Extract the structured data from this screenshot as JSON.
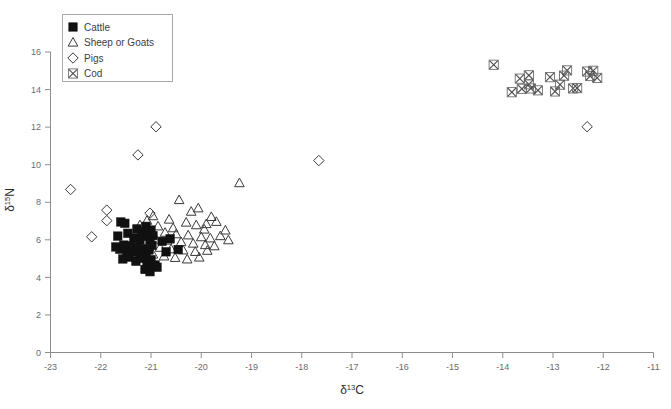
{
  "chart_data": {
    "type": "scatter",
    "title": "",
    "xlabel": "δ¹³C",
    "ylabel": "δ¹⁵N",
    "xlabel_parts": {
      "delta": "δ",
      "sup": "13",
      "elem": "C"
    },
    "ylabel_parts": {
      "delta": "δ",
      "sup": "15",
      "elem": "N"
    },
    "xlim": [
      -23,
      -11
    ],
    "ylim": [
      0,
      16
    ],
    "xticks": [
      -23,
      -22,
      -21,
      -20,
      -19,
      -18,
      -17,
      -16,
      -15,
      -14,
      -13,
      -12,
      -11
    ],
    "yticks": [
      0,
      2,
      4,
      6,
      8,
      10,
      12,
      14,
      16
    ],
    "xtick_labels": [
      "-23",
      "-22",
      "-21",
      "-20",
      "-19",
      "-18",
      "-17",
      "-16",
      "-15",
      "-14",
      "-13",
      "-12",
      "-11"
    ],
    "ytick_labels": [
      "0",
      "2",
      "4",
      "6",
      "8",
      "10",
      "12",
      "14",
      "16"
    ],
    "grid": false,
    "legend_position": "top-left",
    "legend_entries": [
      "Cattle",
      "Sheep or Goats",
      "Pigs",
      "Cod"
    ],
    "series": [
      {
        "name": "Cattle",
        "marker": "filled-square",
        "color": "#111111",
        "points": [
          [
            -21.6,
            6.95
          ],
          [
            -21.46,
            6.35
          ],
          [
            -21.34,
            6.1
          ],
          [
            -21.28,
            6.58
          ],
          [
            -21.22,
            6.0
          ],
          [
            -21.18,
            6.42
          ],
          [
            -21.14,
            6.18
          ],
          [
            -21.1,
            6.72
          ],
          [
            -21.06,
            6.3
          ],
          [
            -21.02,
            5.98
          ],
          [
            -21.0,
            6.52
          ],
          [
            -20.96,
            6.22
          ],
          [
            -21.7,
            5.62
          ],
          [
            -21.62,
            5.5
          ],
          [
            -21.54,
            5.72
          ],
          [
            -21.48,
            5.42
          ],
          [
            -21.4,
            5.68
          ],
          [
            -21.34,
            5.34
          ],
          [
            -21.28,
            5.6
          ],
          [
            -21.22,
            5.26
          ],
          [
            -21.16,
            5.54
          ],
          [
            -21.1,
            5.18
          ],
          [
            -21.04,
            5.46
          ],
          [
            -20.98,
            5.7
          ],
          [
            -21.56,
            4.98
          ],
          [
            -21.44,
            5.08
          ],
          [
            -21.3,
            4.86
          ],
          [
            -21.18,
            5.02
          ],
          [
            -21.08,
            4.74
          ],
          [
            -21.0,
            4.94
          ],
          [
            -20.92,
            4.66
          ],
          [
            -21.12,
            4.42
          ],
          [
            -21.02,
            4.3
          ],
          [
            -20.88,
            4.54
          ],
          [
            -20.78,
            5.92
          ],
          [
            -20.7,
            5.36
          ],
          [
            -20.62,
            6.05
          ],
          [
            -20.46,
            5.48
          ],
          [
            -21.66,
            6.2
          ],
          [
            -21.52,
            6.88
          ]
        ]
      },
      {
        "name": "Sheep or Goats",
        "marker": "open-triangle",
        "color": "#3a3a3a",
        "points": [
          [
            -19.24,
            9.02
          ],
          [
            -20.44,
            8.12
          ],
          [
            -20.06,
            7.68
          ],
          [
            -19.8,
            7.22
          ],
          [
            -20.64,
            7.08
          ],
          [
            -20.3,
            6.92
          ],
          [
            -20.86,
            6.72
          ],
          [
            -20.56,
            6.62
          ],
          [
            -20.1,
            6.78
          ],
          [
            -19.94,
            6.55
          ],
          [
            -19.7,
            6.96
          ],
          [
            -19.52,
            6.5
          ],
          [
            -20.72,
            6.38
          ],
          [
            -20.5,
            6.3
          ],
          [
            -20.26,
            6.24
          ],
          [
            -20.0,
            6.14
          ],
          [
            -19.82,
            6.08
          ],
          [
            -19.62,
            6.2
          ],
          [
            -20.9,
            6.02
          ],
          [
            -20.68,
            5.96
          ],
          [
            -20.4,
            5.88
          ],
          [
            -20.16,
            5.8
          ],
          [
            -19.92,
            5.72
          ],
          [
            -19.74,
            5.66
          ],
          [
            -20.82,
            5.58
          ],
          [
            -20.6,
            5.5
          ],
          [
            -20.36,
            5.44
          ],
          [
            -20.12,
            5.36
          ],
          [
            -19.88,
            5.42
          ],
          [
            -20.74,
            5.12
          ],
          [
            -20.52,
            5.04
          ],
          [
            -20.28,
            4.96
          ],
          [
            -20.04,
            5.06
          ],
          [
            -19.9,
            6.84
          ],
          [
            -19.46,
            5.98
          ],
          [
            -20.2,
            7.5
          ],
          [
            -20.96,
            5.22
          ],
          [
            -21.08,
            7.02
          ],
          [
            -21.22,
            6.78
          ],
          [
            -20.96,
            7.26
          ]
        ]
      },
      {
        "name": "Pigs",
        "marker": "open-diamond",
        "color": "#3a3a3a",
        "points": [
          [
            -22.6,
            8.68
          ],
          [
            -22.18,
            6.16
          ],
          [
            -21.88,
            7.58
          ],
          [
            -21.88,
            7.02
          ],
          [
            -21.26,
            10.52
          ],
          [
            -20.9,
            12.02
          ],
          [
            -21.02,
            7.42
          ],
          [
            -17.66,
            10.22
          ],
          [
            -12.32,
            12.02
          ]
        ]
      },
      {
        "name": "Cod",
        "marker": "x-in-box",
        "color": "#4d4d4d",
        "points": [
          [
            -14.18,
            15.32
          ],
          [
            -13.66,
            14.58
          ],
          [
            -13.48,
            14.76
          ],
          [
            -13.48,
            14.28
          ],
          [
            -13.44,
            14.06
          ],
          [
            -13.62,
            14.04
          ],
          [
            -13.3,
            13.96
          ],
          [
            -13.06,
            14.66
          ],
          [
            -12.72,
            15.02
          ],
          [
            -12.78,
            14.74
          ],
          [
            -12.32,
            14.96
          ],
          [
            -12.26,
            14.72
          ],
          [
            -12.2,
            15.0
          ],
          [
            -12.86,
            14.26
          ],
          [
            -12.6,
            14.06
          ],
          [
            -12.52,
            14.08
          ],
          [
            -13.82,
            13.86
          ],
          [
            -12.96,
            13.9
          ],
          [
            -12.12,
            14.62
          ]
        ]
      }
    ]
  },
  "axes": {
    "x_axis_name": "delta-13-C",
    "y_axis_name": "delta-15-N"
  }
}
